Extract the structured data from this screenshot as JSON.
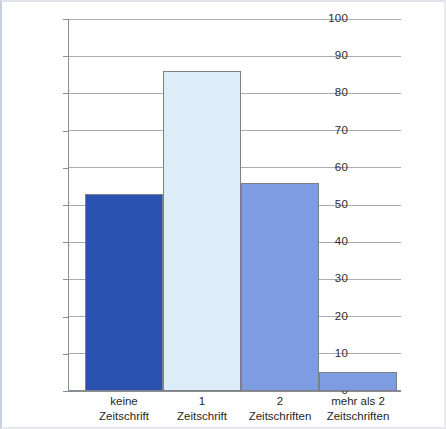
{
  "chart_data": {
    "type": "bar",
    "title": "",
    "subtitle": "",
    "xlabel": "",
    "ylabel": "",
    "categories": [
      "keine Zeitschrift",
      "1 Zeitschrift",
      "2 Zeitschriften",
      "mehr als 2 Zeitschriften"
    ],
    "category_lines": [
      {
        "line1": "keine",
        "line2": "Zeitschrift"
      },
      {
        "line1": "1",
        "line2": "Zeitschrift"
      },
      {
        "line1": "2",
        "line2": "Zeitschriften"
      },
      {
        "line1": "mehr als 2",
        "line2": "Zeitschriften"
      }
    ],
    "values": [
      53,
      86,
      56,
      5
    ],
    "bar_colors": [
      "#2a52b0",
      "#dcedf7",
      "#7e9ce2",
      "#7e9ce2"
    ],
    "bar_border_color": "#7c8087",
    "ylim": [
      0,
      100
    ],
    "yticks": [
      0,
      10,
      20,
      30,
      40,
      50,
      60,
      70,
      80,
      90,
      100
    ],
    "ytick_labels": [
      "0",
      "10",
      "20",
      "30",
      "40",
      "50",
      "60",
      "70",
      "80",
      "90",
      "100"
    ],
    "grid": true,
    "grid_color": "#a9acb2",
    "legend": null,
    "legend_position": "none",
    "annotations": []
  },
  "figure": {
    "background_color": "#ffffff",
    "axis_color": "#8a8d93"
  }
}
